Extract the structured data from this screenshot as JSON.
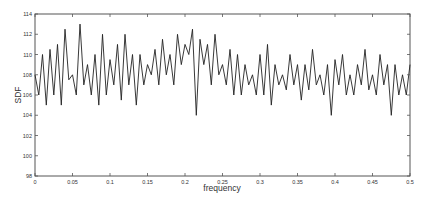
{
  "chart_data": {
    "type": "line",
    "title": "",
    "xlabel": "frequency",
    "ylabel": "SDF",
    "xlim": [
      0,
      0.5
    ],
    "ylim": [
      98,
      114
    ],
    "xticks": [
      0,
      0.05,
      0.1,
      0.15,
      0.2,
      0.25,
      0.3,
      0.35,
      0.4,
      0.45,
      0.5
    ],
    "xtick_labels": [
      "0",
      "0.05",
      "0.1",
      "0.15",
      "0.2",
      "0.25",
      "0.3",
      "0.35",
      "0.4",
      "0.45",
      "0.5"
    ],
    "yticks": [
      98,
      100,
      102,
      104,
      106,
      108,
      110,
      112,
      114
    ],
    "ytick_labels": [
      "98",
      "100",
      "102",
      "104",
      "106",
      "108",
      "110",
      "112",
      "114"
    ],
    "grid": false,
    "legend": null,
    "series": [
      {
        "name": "SDF",
        "color": "#222222",
        "x": [
          0,
          0.005,
          0.01,
          0.015,
          0.02,
          0.025,
          0.03,
          0.035,
          0.04,
          0.045,
          0.05,
          0.055,
          0.06,
          0.065,
          0.07,
          0.075,
          0.08,
          0.085,
          0.09,
          0.095,
          0.1,
          0.105,
          0.11,
          0.115,
          0.12,
          0.125,
          0.13,
          0.135,
          0.14,
          0.145,
          0.15,
          0.155,
          0.16,
          0.165,
          0.17,
          0.175,
          0.18,
          0.185,
          0.19,
          0.195,
          0.2,
          0.205,
          0.21,
          0.215,
          0.22,
          0.225,
          0.23,
          0.235,
          0.24,
          0.245,
          0.25,
          0.255,
          0.26,
          0.265,
          0.27,
          0.275,
          0.28,
          0.285,
          0.29,
          0.295,
          0.3,
          0.305,
          0.31,
          0.315,
          0.32,
          0.325,
          0.33,
          0.335,
          0.34,
          0.345,
          0.35,
          0.355,
          0.36,
          0.365,
          0.37,
          0.375,
          0.38,
          0.385,
          0.39,
          0.395,
          0.4,
          0.405,
          0.41,
          0.415,
          0.42,
          0.425,
          0.43,
          0.435,
          0.44,
          0.445,
          0.45,
          0.455,
          0.46,
          0.465,
          0.47,
          0.475,
          0.48,
          0.485,
          0.49,
          0.495,
          0.5
        ],
        "y": [
          108,
          106,
          110,
          105,
          110.5,
          106,
          111,
          105,
          112.5,
          107.5,
          108,
          106,
          113,
          107,
          109,
          106,
          110,
          105,
          112,
          106,
          109.5,
          107,
          111,
          105.5,
          112,
          107,
          110,
          105,
          110,
          107,
          109,
          108,
          110.5,
          107,
          111.5,
          108,
          110,
          107,
          112,
          109,
          111,
          110,
          112.5,
          104,
          111.5,
          109,
          111,
          107,
          112,
          108,
          109,
          107,
          110.5,
          106,
          110,
          106,
          109,
          107,
          108,
          106,
          110,
          106,
          111,
          105,
          109,
          107,
          108,
          106.5,
          110,
          107,
          109,
          105.5,
          109,
          106.5,
          110.5,
          107,
          108,
          106,
          109,
          104,
          109.5,
          107,
          110,
          106,
          108,
          106,
          109,
          107,
          110.5,
          106.5,
          108,
          106,
          110,
          107,
          109,
          104,
          109,
          106,
          108,
          106,
          109
        ]
      }
    ],
    "annotations": [
      {
        "type": "notable_dip",
        "x": 0.26,
        "y": 100.8
      }
    ]
  }
}
